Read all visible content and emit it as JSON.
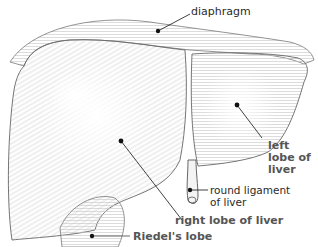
{
  "diagram": {
    "colors": {
      "line": "#555555",
      "hatch": "#b8b8b8",
      "pointer": "#111111",
      "label_regular": "#2a2a2a",
      "label_bold": "#555555"
    },
    "labels": {
      "diaphragm": "diaphragm",
      "left_lobe_1": "left",
      "left_lobe_2": "lobe of",
      "left_lobe_3": "liver",
      "round_ligament_1": "round ligament",
      "round_ligament_2": "of liver",
      "right_lobe": "right lobe of liver",
      "riedels_lobe": "Riedel's lobe"
    }
  }
}
